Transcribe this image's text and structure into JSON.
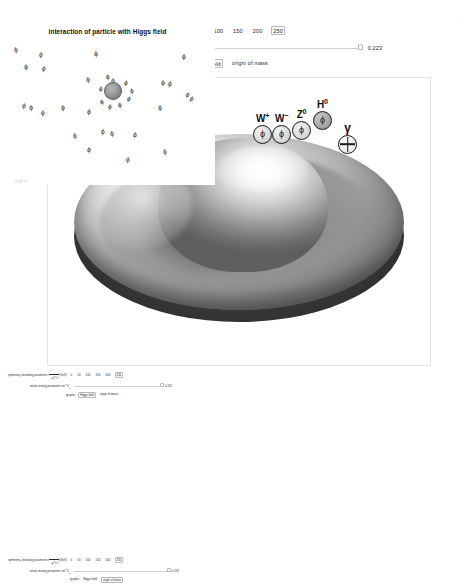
{
  "controls": {
    "symmetry": {
      "label_prefix": "symmetry–breaking parameter",
      "radical": "√",
      "radicand_num": "−μ",
      "radicand_num_sup": "2",
      "slash": "/",
      "radicand_den": "λ",
      "units": "(GeV)",
      "options": [
        "0",
        "50",
        "100",
        "150",
        "200",
        "250"
      ],
      "selected": "250"
    },
    "weak_mixing": {
      "label_prefix": "weak–mixing parameter sin",
      "label_sup": "2",
      "label_symbol": "θ",
      "label_sub": "W",
      "value": "0.223"
    },
    "graphic": {
      "label": "graphic",
      "options": [
        "Higgs field",
        "origin of mass"
      ],
      "selected": "Higgs field"
    }
  },
  "main_graphic": {
    "bosons": [
      {
        "label": "W",
        "sup": "+",
        "glyph": "ϕ",
        "style": "plain"
      },
      {
        "label": "W",
        "sup": "−",
        "glyph": "ϕ",
        "style": "plain"
      },
      {
        "label": "Z",
        "sup": "0",
        "glyph": "ϕ",
        "style": "plain"
      },
      {
        "label": "H",
        "sup": "0",
        "glyph": "ϕ",
        "style": "shaded"
      },
      {
        "label": "γ",
        "sup": "",
        "glyph": "",
        "style": "cross"
      }
    ]
  },
  "left_graphic": {
    "phi_quadruplet": "(ϕ¹, ϕ², ϕ³, ϕ⁴)",
    "gauge_fields": [
      {
        "label": "W",
        "sup": "1"
      },
      {
        "label": "W",
        "sup": "2"
      },
      {
        "label": "W",
        "sup": "3"
      },
      {
        "label": "B",
        "sup": ""
      }
    ]
  },
  "right_graphic": {
    "title": "interaction of particle with Higgs field",
    "field_glyph": "ϕ",
    "field_positions": [
      {
        "x": 14,
        "y": 18,
        "rot": -8
      },
      {
        "x": 39,
        "y": 23,
        "rot": 6
      },
      {
        "x": 24,
        "y": 35,
        "rot": -4
      },
      {
        "x": 42,
        "y": 37,
        "rot": 10
      },
      {
        "x": 94,
        "y": 22,
        "rot": -6
      },
      {
        "x": 182,
        "y": 25,
        "rot": 4
      },
      {
        "x": 86,
        "y": 48,
        "rot": -10
      },
      {
        "x": 111,
        "y": 49,
        "rot": 8
      },
      {
        "x": 161,
        "y": 51,
        "rot": -5
      },
      {
        "x": 168,
        "y": 52,
        "rot": 12
      },
      {
        "x": 22,
        "y": 74,
        "rot": 7
      },
      {
        "x": 29,
        "y": 76,
        "rot": -9
      },
      {
        "x": 41,
        "y": 81,
        "rot": 3
      },
      {
        "x": 61,
        "y": 76,
        "rot": -6
      },
      {
        "x": 87,
        "y": 80,
        "rot": 9
      },
      {
        "x": 158,
        "y": 76,
        "rot": -3
      },
      {
        "x": 186,
        "y": 63,
        "rot": 26
      },
      {
        "x": 190,
        "y": 67,
        "rot": 26
      },
      {
        "x": 73,
        "y": 104,
        "rot": -7
      },
      {
        "x": 101,
        "y": 100,
        "rot": 5
      },
      {
        "x": 110,
        "y": 102,
        "rot": -11
      },
      {
        "x": 133,
        "y": 103,
        "rot": 8
      },
      {
        "x": 87,
        "y": 118,
        "rot": -5
      },
      {
        "x": 126,
        "y": 128,
        "rot": 6
      },
      {
        "x": 163,
        "y": 120,
        "rot": -8
      }
    ],
    "cluster_center": {
      "x": 112,
      "y": 62
    },
    "cluster_phi_positions": [
      {
        "x": 124,
        "y": 52,
        "rot": 14
      },
      {
        "x": 130,
        "y": 60,
        "rot": -12
      },
      {
        "x": 127,
        "y": 68,
        "rot": 20
      },
      {
        "x": 118,
        "y": 74,
        "rot": -6
      },
      {
        "x": 108,
        "y": 76,
        "rot": 11
      },
      {
        "x": 100,
        "y": 71,
        "rot": -18
      },
      {
        "x": 99,
        "y": 58,
        "rot": 7
      },
      {
        "x": 106,
        "y": 46,
        "rot": -9
      }
    ]
  },
  "artifacts": {
    "margin_text": "Ouf f·",
    "corner_text": "◌"
  }
}
